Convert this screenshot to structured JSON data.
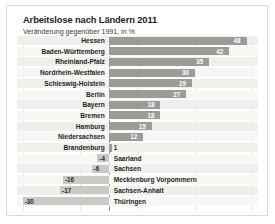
{
  "chart_data": {
    "type": "bar",
    "title": "Arbeitslose nach Ländern 2011",
    "subtitle": "Veränderung gegenüber 1991, in %",
    "xlabel": "",
    "ylabel": "",
    "orientation": "horizontal",
    "grid": true,
    "legend": null,
    "xlim": [
      -32,
      52
    ],
    "gridline_values": [
      -30,
      -10,
      10,
      30,
      50
    ],
    "zero_value": 0,
    "bar_color": "#9b9b97",
    "negative_bar_color": "#c9c9c5",
    "categories": [
      "Hessen",
      "Baden-Württemberg",
      "Rheinland-Pfalz",
      "Nordrhein-Westfalen",
      "Schleswig-Holstein",
      "Berlin",
      "Bayern",
      "Bremen",
      "Hamburg",
      "Niedersachsen",
      "Brandenburg",
      "Saarland",
      "Sachsen",
      "Mecklenburg Vorpommern",
      "Sachsen-Anhalt",
      "Thüringen"
    ],
    "values": [
      48,
      42,
      35,
      30,
      29,
      27,
      18,
      18,
      15,
      12,
      1,
      -4,
      -6,
      -16,
      -17,
      -30
    ],
    "value_labels": [
      "48",
      "42",
      "35",
      "30",
      "29",
      "27",
      "18",
      "18",
      "15",
      "12",
      "1",
      "-4",
      "-6",
      "-16",
      "-17",
      "-30"
    ]
  }
}
